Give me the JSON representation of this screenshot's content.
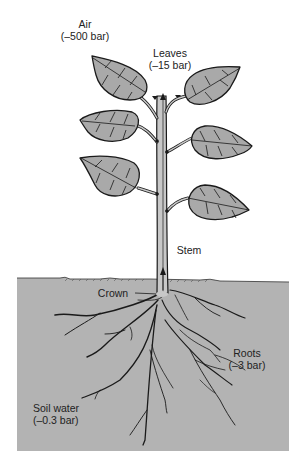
{
  "diagram": {
    "type": "plant water potential gradient",
    "colors": {
      "soil": "#b3b3b3",
      "leaf_fill": "#a9a9a9",
      "outline": "#1a1a1a",
      "stem_fill": "#c8c8c8",
      "background": "#ffffff"
    },
    "labels": {
      "air": {
        "name": "Air",
        "value": "(–500 bar)"
      },
      "leaves": {
        "name": "Leaves",
        "value": "(–15 bar)"
      },
      "stem": {
        "name": "Stem"
      },
      "crown": {
        "name": "Crown"
      },
      "roots": {
        "name": "Roots",
        "value": "(–3 bar)"
      },
      "soil_water": {
        "name": "Soil water",
        "value": "(–0.3 bar)"
      }
    }
  }
}
